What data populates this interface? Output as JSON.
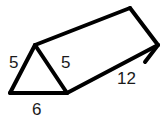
{
  "figure": {
    "name": "triangular-prism",
    "stroke_color": "#000000",
    "fill_color": "#ffffff",
    "background_color": "#ffffff",
    "stroke_width": 4,
    "geometry": {
      "front_triangle": {
        "apex": [
          35,
          45
        ],
        "bottom_left": [
          10,
          93
        ],
        "bottom_right": [
          67,
          93
        ]
      },
      "back_triangle": {
        "apex": [
          130,
          8
        ],
        "bottom_right": [
          158,
          45
        ]
      },
      "top_face": [
        [
          35,
          45
        ],
        [
          130,
          8
        ],
        [
          158,
          45
        ],
        [
          67,
          93
        ]
      ],
      "right_face": [
        [
          67,
          93
        ],
        [
          158,
          45
        ]
      ]
    },
    "labels": [
      {
        "id": "side-left",
        "text": "5",
        "edge": "front-triangle-left-side",
        "x": 9,
        "y": 54
      },
      {
        "id": "side-right",
        "text": "5",
        "edge": "front-triangle-right-side",
        "x": 61,
        "y": 54
      },
      {
        "id": "base",
        "text": "6",
        "edge": "front-triangle-base",
        "x": 32,
        "y": 101
      },
      {
        "id": "length",
        "text": "12",
        "edge": "prism-length",
        "x": 117,
        "y": 70
      }
    ]
  }
}
